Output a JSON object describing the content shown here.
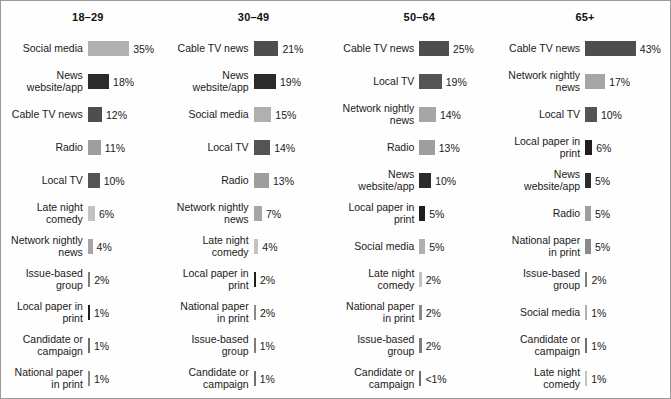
{
  "chart_data": {
    "type": "bar",
    "title": "",
    "subtitle": "",
    "xlabel": "",
    "ylabel": "",
    "orientation": "horizontal",
    "grid": false,
    "legend": "none",
    "value_suffix": "%",
    "px_per_percent": 1.18,
    "panel_layout": "4 columns, one per age group, each sorted descending",
    "category_colors": {
      "Social media": "#b0b0b0",
      "News website/app": "#2b2b2b",
      "Cable TV news": "#4e4e4e",
      "Radio": "#9e9e9e",
      "Local TV": "#545454",
      "Late night comedy": "#c2c2c2",
      "Network nightly news": "#a6a6a6",
      "Issue-based group": "#7d7d7d",
      "Local paper in print": "#1e1e1e",
      "Candidate or campaign": "#6f6f6f",
      "National paper in print": "#8a8a8a"
    },
    "panels": [
      {
        "group": "18–29",
        "categories": [
          "Social media",
          "News website/app",
          "Cable TV news",
          "Radio",
          "Local TV",
          "Late night comedy",
          "Network nightly news",
          "Issue-based group",
          "Local paper in print",
          "Candidate or campaign",
          "National paper in print"
        ],
        "values": [
          35,
          18,
          12,
          11,
          10,
          6,
          4,
          2,
          1,
          1,
          1
        ],
        "labels": [
          "35%",
          "18%",
          "12%",
          "11%",
          "10%",
          "6%",
          "4%",
          "2%",
          "1%",
          "1%",
          "1%"
        ]
      },
      {
        "group": "30–49",
        "categories": [
          "Cable TV news",
          "News website/app",
          "Social media",
          "Local TV",
          "Radio",
          "Network nightly news",
          "Late night comedy",
          "Local paper in print",
          "National paper in print",
          "Issue-based group",
          "Candidate or campaign"
        ],
        "values": [
          21,
          19,
          15,
          14,
          13,
          7,
          4,
          2,
          2,
          1,
          1
        ],
        "labels": [
          "21%",
          "19%",
          "15%",
          "14%",
          "13%",
          "7%",
          "4%",
          "2%",
          "2%",
          "1%",
          "1%"
        ]
      },
      {
        "group": "50–64",
        "categories": [
          "Cable TV news",
          "Local TV",
          "Network nightly news",
          "Radio",
          "News website/app",
          "Local paper in print",
          "Social media",
          "Late night comedy",
          "National paper in print",
          "Issue-based group",
          "Candidate or campaign"
        ],
        "values": [
          25,
          19,
          14,
          13,
          10,
          5,
          5,
          2,
          2,
          2,
          0.5
        ],
        "labels": [
          "25%",
          "19%",
          "14%",
          "13%",
          "10%",
          "5%",
          "5%",
          "2%",
          "2%",
          "2%",
          "<1%"
        ]
      },
      {
        "group": "65+",
        "categories": [
          "Cable TV news",
          "Network nightly news",
          "Local TV",
          "Local paper in print",
          "News website/app",
          "Radio",
          "National paper in print",
          "Issue-based group",
          "Social media",
          "Candidate or campaign",
          "Late night comedy"
        ],
        "values": [
          43,
          17,
          10,
          6,
          5,
          5,
          5,
          2,
          1,
          1,
          1
        ],
        "labels": [
          "43%",
          "17%",
          "10%",
          "6%",
          "5%",
          "5%",
          "5%",
          "2%",
          "1%",
          "1%",
          "1%"
        ]
      }
    ]
  }
}
